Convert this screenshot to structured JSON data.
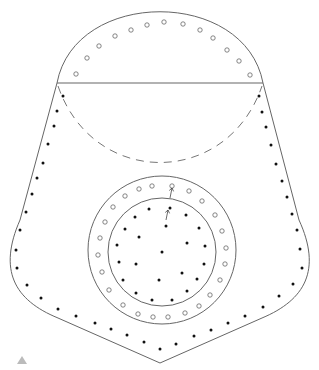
{
  "diagram": {
    "width": 319,
    "height": 370,
    "colors": {
      "background": "#ffffff",
      "stroke": "#666666",
      "dash_stroke": "#777777",
      "filled_dot": "#111111",
      "hollow_dot": "#666666",
      "marker": "#bbbbbb"
    },
    "outline": {
      "description": "Shield/pocket-shaped outline: semicircular top cap over a tapered body ending in a point",
      "top_arc_peak": [
        160,
        10
      ],
      "chord_y": 83,
      "chord_x": [
        57,
        263
      ],
      "bottom_point": [
        160,
        363
      ]
    },
    "dashed_arc": {
      "from": [
        58,
        86
      ],
      "to": [
        262,
        86
      ],
      "lowest_y": 163
    },
    "outer_circle": {
      "cx": 162,
      "cy": 250,
      "r": 74
    },
    "inner_circle": {
      "cx": 162,
      "cy": 252,
      "r": 54
    },
    "markers": {
      "top_hollow_row": [
        [
          76,
          74
        ],
        [
          87,
          58
        ],
        [
          99,
          46
        ],
        [
          115,
          36
        ],
        [
          131,
          30
        ],
        [
          147,
          25
        ],
        [
          164,
          22
        ],
        [
          183,
          24
        ],
        [
          200,
          30
        ],
        [
          213,
          38
        ],
        [
          227,
          50
        ],
        [
          239,
          61
        ],
        [
          250,
          75
        ]
      ],
      "outer_ring_hollow": [
        [
          172,
          186
        ],
        [
          189,
          191
        ],
        [
          202,
          201
        ],
        [
          215,
          215
        ],
        [
          222,
          231
        ],
        [
          226,
          248
        ],
        [
          225,
          264
        ],
        [
          220,
          280
        ],
        [
          210,
          295
        ],
        [
          199,
          306
        ],
        [
          185,
          313
        ],
        [
          168,
          317
        ],
        [
          153,
          317
        ],
        [
          138,
          314
        ],
        [
          123,
          305
        ],
        [
          109,
          290
        ],
        [
          102,
          272
        ],
        [
          98,
          255
        ],
        [
          100,
          238
        ],
        [
          105,
          222
        ],
        [
          113,
          207
        ],
        [
          125,
          196
        ],
        [
          139,
          189
        ],
        [
          152,
          186
        ]
      ],
      "left_filled_column": [
        [
          63,
          96
        ],
        [
          57,
          111
        ],
        [
          54,
          126
        ],
        [
          48,
          144
        ],
        [
          43,
          163
        ],
        [
          37,
          178
        ],
        [
          32,
          194
        ],
        [
          26,
          212
        ],
        [
          20,
          230
        ],
        [
          16,
          250
        ],
        [
          17,
          268
        ],
        [
          27,
          285
        ],
        [
          41,
          298
        ],
        [
          58,
          309
        ],
        [
          76,
          316
        ],
        [
          95,
          323
        ],
        [
          111,
          329
        ],
        [
          127,
          335
        ],
        [
          144,
          342
        ],
        [
          160,
          349
        ]
      ],
      "right_filled_column": [
        [
          259,
          96
        ],
        [
          262,
          112
        ],
        [
          266,
          127
        ],
        [
          271,
          145
        ],
        [
          276,
          164
        ],
        [
          282,
          181
        ],
        [
          287,
          197
        ],
        [
          292,
          214
        ],
        [
          297,
          230
        ],
        [
          300,
          249
        ],
        [
          302,
          268
        ],
        [
          293,
          284
        ],
        [
          279,
          296
        ],
        [
          263,
          307
        ],
        [
          245,
          316
        ],
        [
          228,
          323
        ],
        [
          211,
          330
        ],
        [
          194,
          336
        ],
        [
          176,
          344
        ]
      ],
      "inner_filled": [
        [
          170,
          208
        ],
        [
          186,
          215
        ],
        [
          199,
          228
        ],
        [
          205,
          246
        ],
        [
          204,
          264
        ],
        [
          197,
          279
        ],
        [
          187,
          291
        ],
        [
          172,
          300
        ],
        [
          152,
          300
        ],
        [
          136,
          293
        ],
        [
          123,
          280
        ],
        [
          119,
          262
        ],
        [
          117,
          245
        ],
        [
          125,
          229
        ],
        [
          135,
          217
        ],
        [
          149,
          209
        ],
        [
          166,
          226
        ],
        [
          187,
          243
        ],
        [
          139,
          237
        ],
        [
          162,
          252
        ],
        [
          136,
          264
        ],
        [
          182,
          273
        ],
        [
          159,
          280
        ]
      ],
      "arrows": [
        {
          "from": [
            170,
            198
          ],
          "to": [
            172,
            188
          ]
        },
        {
          "from": [
            166,
            220
          ],
          "to": [
            168,
            210
          ]
        }
      ]
    },
    "corner_marker": {
      "shape": "triangle",
      "position": [
        22,
        360
      ]
    }
  }
}
